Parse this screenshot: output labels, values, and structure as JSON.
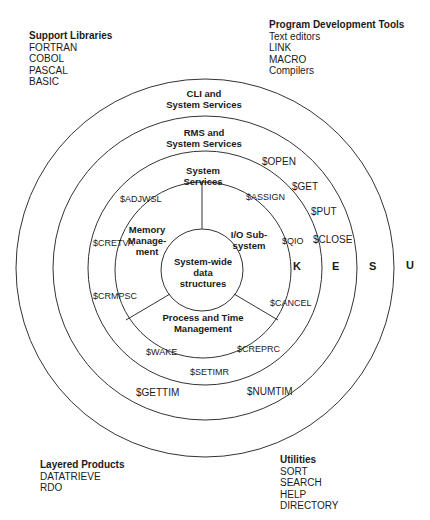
{
  "corners": {
    "support_libraries": {
      "title": "Support Libraries",
      "items": [
        "FORTRAN",
        "COBOL",
        "PASCAL",
        "BASIC"
      ]
    },
    "program_development_tools": {
      "title": "Program Development Tools",
      "items": [
        "Text editors",
        "LINK",
        "MACRO",
        "Compilers"
      ]
    },
    "layered_products": {
      "title": "Layered Products",
      "items": [
        "DATATRIEVE",
        "RDO"
      ]
    },
    "utilities": {
      "title": "Utilities",
      "items": [
        "SORT",
        "SEARCH",
        "HELP",
        "DIRECTORY"
      ]
    }
  },
  "rings": {
    "cli": {
      "line1": "CLI and",
      "line2": "System Services",
      "letter": "U"
    },
    "rms": {
      "line1": "RMS and",
      "line2": "System Services",
      "letter": "S"
    },
    "system_services": {
      "line1": "System",
      "line2": "Services",
      "letter": "E"
    },
    "kernel": {
      "letter": "K"
    },
    "core": {
      "line1": "System-wide",
      "line2": "data",
      "line3": "structures"
    }
  },
  "sectors": {
    "memory": {
      "line1": "Memory",
      "line2": "Manage-",
      "line3": "ment"
    },
    "io": {
      "line1": "I/O Sub-",
      "line2": "system"
    },
    "process": {
      "line1": "Process and Time",
      "line2": "Management"
    }
  },
  "calls": {
    "open": "$OPEN",
    "get": "$GET",
    "put": "$PUT",
    "close": "$CLOSE",
    "assign": "$ASSIGN",
    "qio": "$QIO",
    "cancel": "$CANCEL",
    "adjwsl": "$ADJWSL",
    "cretva": "$CRETVA",
    "crmpsc": "$CRMPSC",
    "wake": "$WAKE",
    "setimr": "$SETIMR",
    "creprc": "$CREPRC",
    "gettim": "$GETTIM",
    "numtim": "$NUMTIM"
  }
}
